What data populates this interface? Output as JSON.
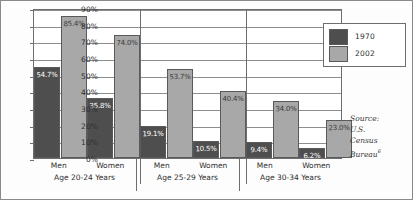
{
  "chart_data": {
    "type": "bar",
    "title": "",
    "xlabel": "",
    "ylabel": "",
    "ylim": [
      0,
      90
    ],
    "grid": true,
    "legend_position": "inside top-right",
    "ytick_labels": [
      "90%",
      "80%",
      "70%",
      "60%",
      "50%",
      "40%",
      "30%",
      "20%",
      "10%",
      "0%"
    ],
    "ytick_values": [
      90,
      80,
      70,
      60,
      50,
      40,
      30,
      20,
      10,
      0
    ],
    "categories": [
      "Men",
      "Women",
      "Men",
      "Women",
      "Men",
      "Women"
    ],
    "group_labels": [
      "Age 20-24 Years",
      "Age 25-29 Years",
      "Age 30-34 Years"
    ],
    "series": [
      {
        "name": "1970",
        "color": "#4e4e4e",
        "values": [
          54.7,
          35.8,
          19.1,
          10.5,
          9.4,
          6.2
        ]
      },
      {
        "name": "2002",
        "color": "#a8a8a8",
        "values": [
          85.4,
          74.0,
          53.7,
          40.4,
          34.0,
          23.0
        ]
      }
    ],
    "data_labels": [
      [
        "54.7%",
        "35.8%",
        "19.1%",
        "10.5%",
        "9.4%",
        "6.2%"
      ],
      [
        "85.4%",
        "74.0%",
        "53.7%",
        "40.4%",
        "34.0%",
        "23.0%"
      ]
    ]
  },
  "legend": {
    "entries": [
      {
        "label": "1970"
      },
      {
        "label": "2002"
      }
    ]
  },
  "source_note": {
    "line1": "Source:",
    "line2": "U.S.",
    "line3": "Census",
    "line4": "Bureau",
    "footnote": "6"
  }
}
